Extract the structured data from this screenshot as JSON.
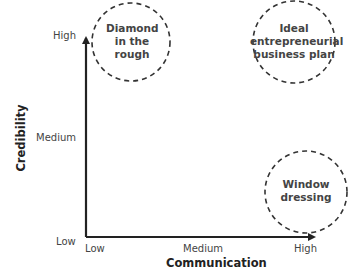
{
  "diagram": {
    "y_axis": {
      "title": "Credibility",
      "ticks": [
        "High",
        "Medium",
        "Low"
      ]
    },
    "x_axis": {
      "title": "Communication",
      "ticks": [
        "Low",
        "Medium",
        "High"
      ]
    },
    "regions": [
      {
        "label_lines": [
          "Diamond",
          "in the",
          "rough"
        ],
        "position": "high credibility, low communication"
      },
      {
        "label_lines": [
          "Ideal",
          "entrepreneurial",
          "business plan"
        ],
        "position": "high credibility, high communication"
      },
      {
        "label_lines": [
          "Window",
          "dressing"
        ],
        "position": "low credibility, high communication"
      }
    ],
    "colors": {
      "axis": "#222222",
      "circle_stroke": "#333333",
      "text": "#444444"
    }
  }
}
